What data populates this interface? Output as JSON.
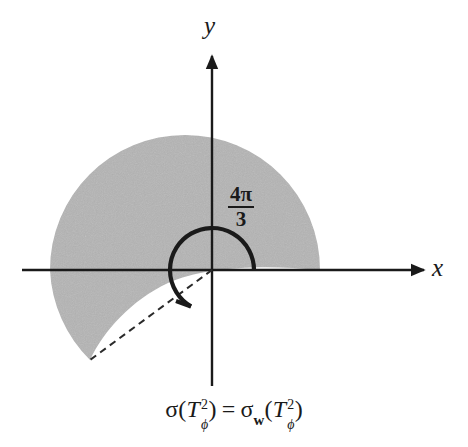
{
  "figure": {
    "kind": "polar-sector-diagram",
    "background_color": "#ffffff",
    "ink_color": "#1a1a1a",
    "shade_color": "#b4b4b4"
  },
  "axes": {
    "x_label": "x",
    "y_label": "y",
    "origin": {
      "x": 212,
      "y": 270
    },
    "x_axis": {
      "start_x": 22,
      "end_x": 428,
      "arrow": "right"
    },
    "y_axis": {
      "top_y": 52,
      "bottom_y": 386,
      "arrow": "up"
    }
  },
  "angle": {
    "label_numerator": "4π",
    "label_denominator": "3",
    "label_full": "4π/3",
    "degrees": 240,
    "arc_radius": 42,
    "arc_start_deg": 0,
    "arc_end_deg": 240,
    "arc_color": "#1a1a1a"
  },
  "shaded_region": {
    "name": "spiral-sector",
    "fill": "#b4b4b4",
    "outer_radius": 135,
    "sweep_start_deg": 0,
    "sweep_end_deg": 240,
    "inner_boundary": "spiral",
    "tip": {
      "x": 90,
      "y": 360
    }
  },
  "dashed_ray": {
    "from": {
      "x": 212,
      "y": 270
    },
    "to": {
      "x": 90,
      "y": 360
    },
    "style": "dashed",
    "dash_pattern": "7 5",
    "color": "#2a2a2a"
  },
  "caption": {
    "sigma": "σ",
    "sigma_w_sub": "w",
    "T": "T",
    "T_sup": "2",
    "T_sub": "ϕ",
    "equals": "=",
    "open_paren": "(",
    "close_paren": ")",
    "full_text": "σ(T²_ϕ) = σ_w(T²_ϕ)"
  }
}
